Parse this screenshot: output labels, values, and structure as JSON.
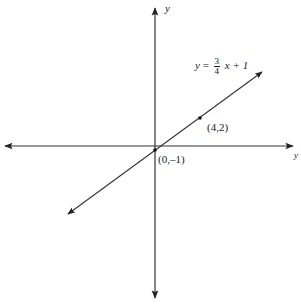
{
  "diagram": {
    "type": "coordinate-plane-line",
    "axes": {
      "x_label": "y",
      "y_label": "y"
    },
    "equation": {
      "lhs": "y",
      "equals": "=",
      "numerator": "3",
      "denominator": "4",
      "rest": "x + 1"
    },
    "points": [
      {
        "label": "(4,2)"
      },
      {
        "label": "(0,–1)"
      }
    ],
    "colors": {
      "axis": "#222222",
      "line": "#333333"
    }
  }
}
